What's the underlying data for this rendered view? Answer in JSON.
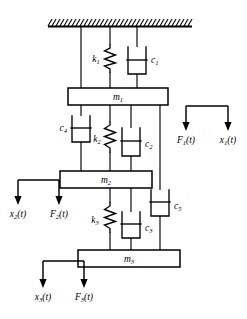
{
  "figure": {
    "background_color": "#ffffff",
    "line_color": "#000000"
  },
  "ceiling": {
    "name": "fixed-support",
    "hatch_label": "hatched rigid ceiling",
    "x_start": 48,
    "x_end": 192,
    "y": 26,
    "hatch_count": 36
  },
  "masses": [
    {
      "id": "m1",
      "label": "m",
      "subscript": "1",
      "x": 68,
      "y": 88,
      "w": 100,
      "h": 17
    },
    {
      "id": "m2",
      "label": "m",
      "subscript": "2",
      "x": 60,
      "y": 171,
      "w": 92,
      "h": 17
    },
    {
      "id": "m3",
      "label": "m",
      "subscript": "3",
      "x": 78,
      "y": 250,
      "w": 102,
      "h": 17
    }
  ],
  "springs": [
    {
      "id": "k1",
      "label": "k",
      "subscript": "1",
      "x": 110,
      "y_top": 45,
      "y_bottom": 72,
      "label_x": 96,
      "label_y": 62
    },
    {
      "id": "k2",
      "label": "k",
      "subscript": "2",
      "x": 110,
      "y_top": 122,
      "y_bottom": 152,
      "label_x": 97,
      "label_y": 142
    },
    {
      "id": "k3",
      "label": "k",
      "subscript": "3",
      "x": 110,
      "y_top": 203,
      "y_bottom": 232,
      "label_x": 95,
      "label_y": 223
    }
  ],
  "dampers": [
    {
      "id": "c1",
      "label": "c",
      "subscript": "1",
      "x": 137,
      "y_top": 47,
      "y_bottom": 74,
      "label_x": 151,
      "label_y": 63
    },
    {
      "id": "c2",
      "label": "c",
      "subscript": "2",
      "x": 131,
      "y_top": 128,
      "y_bottom": 156,
      "label_x": 145,
      "label_y": 147
    },
    {
      "id": "c3",
      "label": "c",
      "subscript": "3",
      "x": 131,
      "y_top": 212,
      "y_bottom": 238,
      "label_x": 145,
      "label_y": 231
    },
    {
      "id": "c4",
      "label": "c",
      "subscript": "4",
      "x": 81,
      "y_top": 116,
      "y_bottom": 142,
      "label_x": 62,
      "label_y": 131
    },
    {
      "id": "c5",
      "label": "c",
      "subscript": "5",
      "x": 160,
      "y_top": 190,
      "y_bottom": 216,
      "label_x": 174,
      "label_y": 209
    }
  ],
  "force_groups": [
    {
      "id": "group1",
      "side": "right",
      "bar_x1": 186,
      "bar_x2": 228,
      "bar_y": 106,
      "arrow_bottom": 130,
      "labels": [
        {
          "symbol": "F",
          "subscript": "1",
          "suffix": "(t)",
          "x": 186,
          "text_x": 186,
          "text_y": 142
        },
        {
          "symbol": "x",
          "subscript": "1",
          "suffix": "(t)",
          "x": 228,
          "text_x": 228,
          "text_y": 142
        }
      ]
    },
    {
      "id": "group2",
      "side": "left",
      "bar_x1": 18,
      "bar_x2": 59,
      "bar_y": 180,
      "arrow_bottom": 204,
      "labels": [
        {
          "symbol": "x",
          "subscript": "2",
          "suffix": "(t)",
          "x": 18,
          "text_x": 18,
          "text_y": 216
        },
        {
          "symbol": "F",
          "subscript": "2",
          "suffix": "(t)",
          "x": 59,
          "text_x": 59,
          "text_y": 216
        }
      ]
    },
    {
      "id": "group3",
      "side": "left",
      "bar_x1": 43,
      "bar_x2": 84,
      "bar_y": 261,
      "arrow_bottom": 287,
      "labels": [
        {
          "symbol": "x",
          "subscript": "3",
          "suffix": "(t)",
          "x": 43,
          "text_x": 43,
          "text_y": 299
        },
        {
          "symbol": "F",
          "subscript": "3",
          "suffix": "(t)",
          "x": 84,
          "text_x": 84,
          "text_y": 299
        }
      ]
    }
  ],
  "connectors": {
    "ceiling_drops": [
      81,
      110,
      137
    ],
    "right_branch_x": 160,
    "notes": "vertical rods linking ceiling, masses, springs and dampers"
  }
}
